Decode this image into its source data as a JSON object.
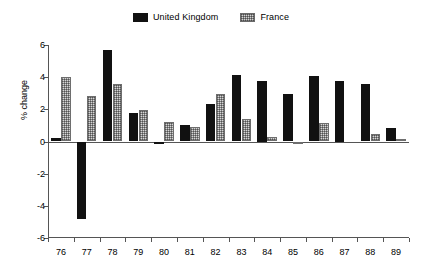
{
  "chart_data": {
    "type": "bar",
    "title": "",
    "subtitle": "",
    "xlabel": "",
    "ylabel": "% change",
    "categories": [
      "76",
      "77",
      "78",
      "79",
      "80",
      "81",
      "82",
      "83",
      "84",
      "85",
      "86",
      "87",
      "88",
      "89"
    ],
    "series": [
      {
        "name": "United Kingdom",
        "color": "#111111",
        "values": [
          0.2,
          -4.8,
          5.7,
          1.8,
          -0.15,
          1.0,
          2.35,
          4.15,
          3.75,
          2.95,
          4.05,
          3.75,
          3.55,
          0.85
        ]
      },
      {
        "name": "France",
        "color": "#d6d6d6",
        "values": [
          4.0,
          2.8,
          3.6,
          1.95,
          1.2,
          0.9,
          2.95,
          1.4,
          0.25,
          -0.15,
          1.15,
          0.0,
          0.45,
          0.15
        ]
      }
    ],
    "ylim": [
      -6,
      6
    ],
    "yticks": [
      6,
      4,
      2,
      0,
      -2,
      -4,
      -6
    ],
    "ytick_labels": [
      "6",
      "4",
      "2",
      "0",
      "-2",
      "-4",
      "-6"
    ],
    "grid": false,
    "legend_position": "top-center",
    "legend_entries": [
      "United Kingdom",
      "France"
    ]
  }
}
